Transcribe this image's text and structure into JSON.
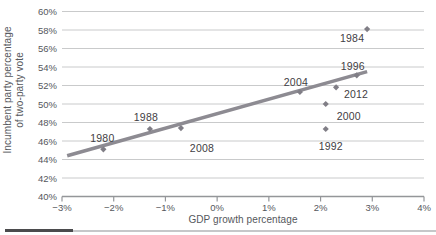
{
  "labels": {
    "y_title_line1": "Incumbent party percentage",
    "y_title_line2": "of two-party vote",
    "x_title": "GDP growth percentage"
  },
  "colors": {
    "gridline": "#c9cacb",
    "axis": "#949699",
    "tick_label": "#55575c",
    "axis_title": "#55575c",
    "point": "#807e86",
    "trend_line": "#8d8b92",
    "year_label": "#3f4043",
    "caption_rule_dark": "#4b4b4d",
    "caption_rule_light": "#c6c7c9"
  },
  "chart_data": {
    "type": "scatter",
    "title": "",
    "xlabel": "GDP growth percentage",
    "ylabel": "Incumbent party percentage of two-party vote",
    "grid": "horizontal-only",
    "legend": "none",
    "x_axis": {
      "min": -3,
      "max": 4,
      "tick_step": 1,
      "tick_labels": [
        "−3%",
        "−2%",
        "−1%",
        "0%",
        "1%",
        "2%",
        "3%",
        "4%"
      ]
    },
    "y_axis": {
      "min": 40,
      "max": 60,
      "tick_step": 2,
      "tick_labels": [
        "40%",
        "42%",
        "44%",
        "46%",
        "48%",
        "50%",
        "52%",
        "54%",
        "56%",
        "58%",
        "60%"
      ]
    },
    "points": [
      {
        "label": "1980",
        "x": -2.2,
        "y": 45.1,
        "label_offset": [
          -1,
          -11
        ]
      },
      {
        "label": "1988",
        "x": -1.3,
        "y": 47.3,
        "label_offset": [
          -4,
          -11
        ]
      },
      {
        "label": "2008",
        "x": -0.7,
        "y": 47.4,
        "label_offset": [
          21,
          20
        ]
      },
      {
        "label": "2004",
        "x": 1.6,
        "y": 51.3,
        "label_offset": [
          -4,
          -9
        ]
      },
      {
        "label": "1996",
        "x": 2.7,
        "y": 53.1,
        "label_offset": [
          -4,
          -9
        ]
      },
      {
        "label": "2012",
        "x": 2.3,
        "y": 51.8,
        "label_offset": [
          20,
          7
        ]
      },
      {
        "label": "2000",
        "x": 2.1,
        "y": 50.0,
        "label_offset": [
          23,
          12
        ]
      },
      {
        "label": "1992",
        "x": 2.1,
        "y": 47.3,
        "label_offset": [
          5,
          18
        ]
      },
      {
        "label": "1984",
        "x": 2.9,
        "y": 58.1,
        "label_offset": [
          -15,
          9
        ]
      }
    ],
    "trend_line": {
      "x1": -2.9,
      "y1": 44.4,
      "x2": 2.9,
      "y2": 53.5
    }
  }
}
